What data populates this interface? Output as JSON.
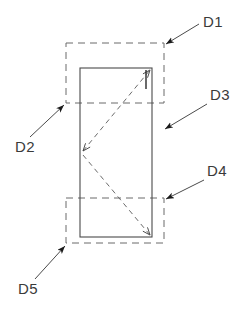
{
  "figure": {
    "type": "technical-line-drawing",
    "background_color": "#ffffff",
    "line_color": "#4a4a4a",
    "dashed_line_color": "#6b6b6b",
    "label_color": "#3a3a3a",
    "solid_body": {
      "name": "main-rectangle",
      "x": 80,
      "y": 68,
      "width": 72,
      "height": 169,
      "stroke": "#4a4a4a",
      "stroke_width": 1,
      "style": "solid"
    },
    "dashed_regions": [
      {
        "name": "upper-dashed-rectangle",
        "x": 66,
        "y": 43,
        "width": 98,
        "height": 60,
        "style": "dashed",
        "dash_pattern": "7 5"
      },
      {
        "name": "lower-dashed-rectangle",
        "x": 66,
        "y": 198,
        "width": 98,
        "height": 45,
        "style": "dashed",
        "dash_pattern": "7 5"
      }
    ],
    "internal_diagonals": [
      {
        "name": "upper-diagonal",
        "x1": 81,
        "y1": 153,
        "x2": 152,
        "y2": 68,
        "style": "dashed",
        "arrowheads": "both"
      },
      {
        "name": "lower-diagonal",
        "x1": 81,
        "y1": 153,
        "x2": 152,
        "y2": 237,
        "style": "dashed",
        "arrowheads": "both"
      }
    ],
    "tick_marks": [
      {
        "name": "vertical-tick-mark",
        "x1": 146,
        "y1": 70,
        "x2": 146,
        "y2": 89,
        "style": "solid"
      }
    ]
  },
  "callouts": [
    {
      "id": "D1",
      "label": "D1",
      "label_x": 203,
      "label_y": 27,
      "leader": {
        "x1": 199,
        "y1": 24,
        "x2": 166,
        "y2": 44
      },
      "arrow_at": "end",
      "points_to": "upper-dashed-rectangle-top-right-corner"
    },
    {
      "id": "D2",
      "label": "D2",
      "label_x": 15,
      "label_y": 152,
      "leader": {
        "x1": 30,
        "y1": 137,
        "x2": 64,
        "y2": 105
      },
      "arrow_at": "end",
      "points_to": "upper-dashed-rectangle-bottom-left-corner"
    },
    {
      "id": "D3",
      "label": "D3",
      "label_x": 210,
      "label_y": 100,
      "leader": {
        "x1": 207,
        "y1": 104,
        "x2": 165,
        "y2": 129
      },
      "arrow_at": "end",
      "points_to": "main-rectangle-right-side"
    },
    {
      "id": "D4",
      "label": "D4",
      "label_x": 207,
      "label_y": 176,
      "leader": {
        "x1": 204,
        "y1": 180,
        "x2": 166,
        "y2": 199
      },
      "arrow_at": "end",
      "points_to": "lower-dashed-rectangle-top-right-corner"
    },
    {
      "id": "D5",
      "label": "D5",
      "label_x": 18,
      "label_y": 294,
      "leader": {
        "x1": 35,
        "y1": 279,
        "x2": 65,
        "y2": 246
      },
      "arrow_at": "end",
      "points_to": "lower-dashed-rectangle-bottom-left-corner"
    }
  ]
}
